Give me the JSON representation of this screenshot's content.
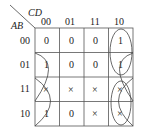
{
  "kmap": {
    "row_var": "AB",
    "col_var": "CD",
    "col_labels": [
      "00",
      "01",
      "11",
      "10"
    ],
    "row_labels": [
      "00",
      "01",
      "11",
      "10"
    ],
    "cells": [
      [
        "0",
        "0",
        "0",
        "1"
      ],
      [
        "1",
        "0",
        "0",
        "1"
      ],
      [
        "×",
        "×",
        "×",
        "×"
      ],
      [
        "1",
        "0",
        "×",
        "×"
      ]
    ],
    "groups": [
      "column-10 vertical loop (rows 00-01)",
      "wrap-around rows 01-11 (cols 00 & 10)",
      "wrap-around rows 11-10 (cols 00 & 10)",
      "column-10 rows 11-10 loop"
    ]
  }
}
